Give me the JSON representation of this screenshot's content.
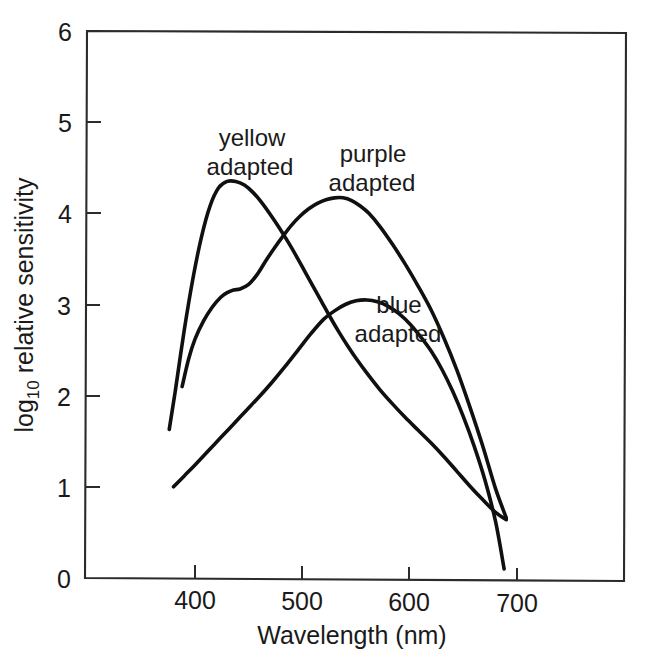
{
  "chart_data": {
    "type": "line",
    "title": "",
    "xlabel": "Wavelength (nm)",
    "ylabel": "log10 relative sensitivity",
    "ylabel_base": "log",
    "ylabel_sub": "10",
    "ylabel_rest": " relative sensitivity",
    "xlim": [
      355,
      755
    ],
    "ylim": [
      0,
      6
    ],
    "xticks": [
      400,
      500,
      600,
      700
    ],
    "xtick_labels": [
      "400",
      "500",
      "600",
      "700"
    ],
    "yticks": [
      0,
      1,
      2,
      3,
      4,
      5,
      6
    ],
    "ytick_labels": [
      "0",
      "1",
      "2",
      "3",
      "4",
      "5",
      "6"
    ],
    "grid": false,
    "legend": "inline-annotations",
    "line_color": "#101010",
    "axis_color": "#2b2b2b",
    "background": "#ffffff",
    "series": [
      {
        "name": "yellow adapted",
        "label": "yellow",
        "label_line2": "adapted",
        "label_x": 440,
        "label_y": 4.95,
        "x": [
          376,
          382,
          390,
          398,
          406,
          414,
          422,
          430,
          438,
          446,
          454,
          462,
          470,
          478,
          486,
          494,
          502,
          510,
          518,
          526,
          534,
          542,
          550,
          560,
          572,
          584,
          596,
          608,
          620,
          632,
          644,
          656,
          668,
          680,
          690
        ],
        "y": [
          1.63,
          2.08,
          2.72,
          3.28,
          3.74,
          4.08,
          4.28,
          4.35,
          4.35,
          4.31,
          4.23,
          4.12,
          3.99,
          3.85,
          3.7,
          3.54,
          3.37,
          3.2,
          3.03,
          2.86,
          2.7,
          2.55,
          2.41,
          2.25,
          2.07,
          1.91,
          1.76,
          1.62,
          1.48,
          1.33,
          1.17,
          1.01,
          0.86,
          0.72,
          0.64
        ]
      },
      {
        "name": "purple adapted",
        "label": "purple",
        "label_line2": "adapted",
        "label_x": 560,
        "label_y": 4.85,
        "x": [
          388,
          394,
          400,
          408,
          416,
          424,
          430,
          436,
          442,
          450,
          458,
          466,
          474,
          482,
          490,
          498,
          506,
          514,
          522,
          530,
          538,
          546,
          554,
          562,
          572,
          584,
          596,
          608,
          620,
          632,
          644,
          656,
          668,
          680,
          690
        ],
        "y": [
          2.1,
          2.4,
          2.62,
          2.82,
          2.97,
          3.08,
          3.13,
          3.16,
          3.17,
          3.22,
          3.33,
          3.48,
          3.62,
          3.75,
          3.87,
          3.97,
          4.05,
          4.11,
          4.15,
          4.17,
          4.17,
          4.14,
          4.08,
          4.0,
          3.86,
          3.66,
          3.44,
          3.2,
          2.94,
          2.63,
          2.28,
          1.88,
          1.45,
          0.98,
          0.66
        ]
      },
      {
        "name": "blue adapted",
        "label": "blue",
        "label_line2": "adapted",
        "label_x": 570,
        "label_y": 3.15,
        "x": [
          380,
          390,
          400,
          412,
          424,
          436,
          448,
          460,
          472,
          484,
          496,
          508,
          520,
          530,
          540,
          550,
          560,
          570,
          580,
          590,
          600,
          610,
          620,
          630,
          640,
          650,
          660,
          670,
          680,
          688
        ],
        "y": [
          1.0,
          1.12,
          1.24,
          1.39,
          1.54,
          1.69,
          1.84,
          1.99,
          2.15,
          2.32,
          2.5,
          2.68,
          2.84,
          2.93,
          3.0,
          3.04,
          3.05,
          3.03,
          2.98,
          2.9,
          2.79,
          2.65,
          2.49,
          2.29,
          2.05,
          1.77,
          1.45,
          1.08,
          0.62,
          0.1
        ]
      }
    ]
  }
}
